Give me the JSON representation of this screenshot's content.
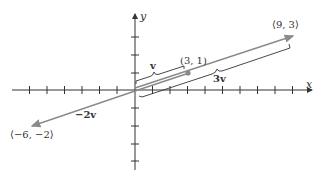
{
  "diagram": {
    "title": "",
    "axes": {
      "x_label": "x",
      "y_label": "y",
      "x_ticks": [
        -7,
        -6,
        -5,
        -4,
        -3,
        -2,
        -1,
        1,
        2,
        3,
        4,
        5,
        6,
        7,
        8,
        9
      ],
      "y_ticks": [
        -4,
        -3,
        -2,
        -1,
        1,
        2,
        3,
        4
      ]
    },
    "vectors": [
      {
        "name": "v",
        "label": "v",
        "from": [
          0,
          0
        ],
        "to": [
          3,
          1
        ],
        "point_label": "(3, 1)"
      },
      {
        "name": "3v",
        "label": "3v",
        "from": [
          0,
          0
        ],
        "to": [
          9,
          3
        ],
        "point_label": "⟨9, 3⟩"
      },
      {
        "name": "-2v",
        "label": "−2v",
        "from": [
          0,
          0
        ],
        "to": [
          -6,
          -2
        ],
        "point_label": "⟨−6, −2⟩"
      }
    ],
    "colors": {
      "axis": "#333333",
      "vector": "#8a8a8a",
      "brace": "#333333",
      "point": "#8a8a8a"
    }
  }
}
